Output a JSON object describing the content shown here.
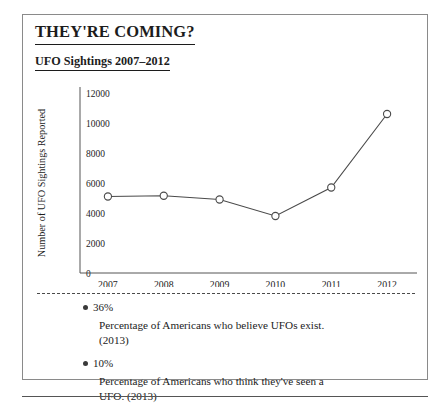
{
  "header": {
    "title": "THEY'RE COMING?",
    "subtitle": "UFO Sightings 2007–2012"
  },
  "chart_data": {
    "type": "line",
    "title": "UFO Sightings 2007–2012",
    "xlabel": "",
    "ylabel": "Number of UFO Sightings Reported",
    "categories": [
      "2007",
      "2008",
      "2009",
      "2010",
      "2011",
      "2012"
    ],
    "values": [
      5100,
      5150,
      4900,
      3800,
      5700,
      10600
    ],
    "ytick_labels": [
      "0",
      "2000",
      "4000",
      "6000",
      "8000",
      "10000",
      "12000"
    ],
    "ytick_values": [
      0,
      2000,
      4000,
      6000,
      8000,
      10000,
      12000
    ],
    "ylim": [
      0,
      12000
    ],
    "grid": false,
    "legend": "none",
    "marker": "open-circle",
    "line_color": "#4a4a4a",
    "marker_fill": "#ffffff"
  },
  "notes": [
    {
      "value": "36%",
      "description": "Percentage of Americans who believe UFOs exist. (2013)"
    },
    {
      "value": "10%",
      "description": "Percentage of Americans who think they've seen a UFO. (2013)"
    }
  ]
}
